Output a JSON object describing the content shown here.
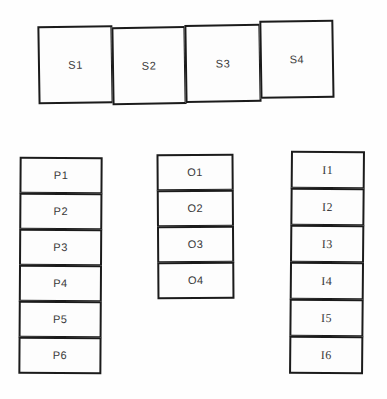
{
  "diagram": {
    "background_color": "#fefefe",
    "ink_color": "#1b1b1b",
    "label_color": "#3a3a3a",
    "groups": [
      {
        "name": "s-row",
        "orientation": "horizontal",
        "count": 4,
        "cells": [
          {
            "label": "S1"
          },
          {
            "label": "S2"
          },
          {
            "label": "S3"
          },
          {
            "label": "S4"
          }
        ]
      },
      {
        "name": "p-column",
        "orientation": "vertical",
        "count": 6,
        "cells": [
          {
            "label": "P1"
          },
          {
            "label": "P2"
          },
          {
            "label": "P3"
          },
          {
            "label": "P4"
          },
          {
            "label": "P5"
          },
          {
            "label": "P6"
          }
        ]
      },
      {
        "name": "o-column",
        "orientation": "vertical",
        "count": 4,
        "cells": [
          {
            "label": "O1"
          },
          {
            "label": "O2"
          },
          {
            "label": "O3"
          },
          {
            "label": "O4"
          }
        ]
      },
      {
        "name": "i-column",
        "orientation": "vertical",
        "count": 6,
        "cells": [
          {
            "label": "I1"
          },
          {
            "label": "I2"
          },
          {
            "label": "I3"
          },
          {
            "label": "I4"
          },
          {
            "label": "I5"
          },
          {
            "label": "I6"
          }
        ]
      }
    ]
  }
}
